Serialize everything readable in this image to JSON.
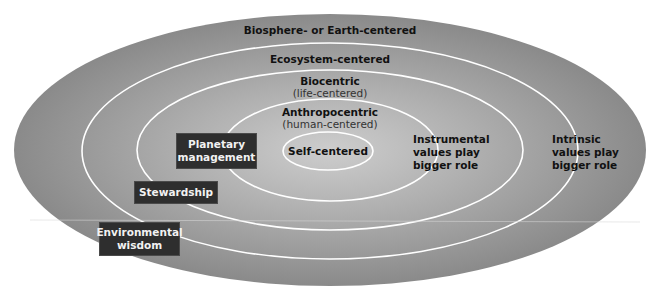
{
  "colors": {
    "outer_fill": "#8e8e8e",
    "center_fill": "#cdcdcd",
    "ring_stroke": "#ffffff",
    "box_fill": "#2e2e2e",
    "box_text": "#f2f2f2",
    "label_text": "#111111"
  },
  "rings": [
    {
      "name": "biosphere",
      "label": "Biosphere- or Earth-centered",
      "sublabel": ""
    },
    {
      "name": "ecosystem",
      "label": "Ecosystem-centered",
      "sublabel": ""
    },
    {
      "name": "biocentric",
      "label": "Biocentric",
      "sublabel": "(life-centered)"
    },
    {
      "name": "anthropocentric",
      "label": "Anthropocentric",
      "sublabel": "(human-centered)"
    },
    {
      "name": "self",
      "label": "Self-centered",
      "sublabel": ""
    }
  ],
  "worldviews": [
    {
      "label_line1": "Planetary",
      "label_line2": "management"
    },
    {
      "label_line1": "Stewardship",
      "label_line2": ""
    },
    {
      "label_line1": "Environmental",
      "label_line2": "wisdom"
    }
  ],
  "annotations": {
    "instrumental": {
      "line1": "Instrumental",
      "line2": "values play",
      "line3": "bigger role"
    },
    "intrinsic": {
      "line1": "Intrinsic",
      "line2": "values play",
      "line3": "bigger role"
    }
  }
}
